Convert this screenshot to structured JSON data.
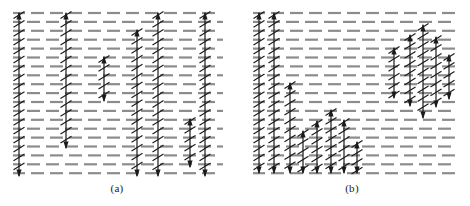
{
  "figure": {
    "background_color": "#ffffff",
    "dash_color": "#8c8c8c",
    "arrow_color": "#1a1a1a",
    "width": 470,
    "height": 206
  },
  "panels": [
    {
      "id": "a",
      "caption": "(a)",
      "caption_x": 117,
      "caption_y": 182,
      "x": 12,
      "y": 10,
      "width": 212,
      "height": 166,
      "lattice": {
        "rows": 19,
        "row_spacing": 8.9,
        "dash_length": 13,
        "dash_gap": 6,
        "dash_thickness": 2.2
      },
      "arrows": [
        {
          "x": 19,
          "y_top": 13,
          "y_bottom": 176,
          "head_top": true,
          "head_bottom": true
        },
        {
          "x": 66,
          "y_top": 13,
          "y_bottom": 148,
          "head_top": true,
          "head_bottom": true
        },
        {
          "x": 104,
          "y_top": 57,
          "y_bottom": 101,
          "head_top": true,
          "head_bottom": true
        },
        {
          "x": 137,
          "y_top": 30,
          "y_bottom": 176,
          "head_top": true,
          "head_bottom": true
        },
        {
          "x": 158,
          "y_top": 13,
          "y_bottom": 176,
          "head_top": true,
          "head_bottom": true
        },
        {
          "x": 190,
          "y_top": 119,
          "y_bottom": 167,
          "head_top": true,
          "head_bottom": true
        },
        {
          "x": 205,
          "y_top": 13,
          "y_bottom": 176,
          "head_top": true,
          "head_bottom": true
        }
      ]
    },
    {
      "id": "b",
      "caption": "(b)",
      "caption_x": 352,
      "caption_y": 182,
      "x": 252,
      "y": 10,
      "width": 206,
      "height": 166,
      "lattice": {
        "rows": 19,
        "row_spacing": 8.9,
        "dash_length": 13,
        "dash_gap": 6,
        "dash_thickness": 2.2
      },
      "arrows": [
        {
          "x": 259,
          "y_top": 13,
          "y_bottom": 173,
          "head_top": true,
          "head_bottom": true
        },
        {
          "x": 274,
          "y_top": 13,
          "y_bottom": 173,
          "head_top": true,
          "head_bottom": true
        },
        {
          "x": 290,
          "y_top": 83,
          "y_bottom": 173,
          "head_top": true,
          "head_bottom": true
        },
        {
          "x": 303,
          "y_top": 131,
          "y_bottom": 173,
          "head_top": true,
          "head_bottom": true
        },
        {
          "x": 317,
          "y_top": 121,
          "y_bottom": 173,
          "head_top": true,
          "head_bottom": true
        },
        {
          "x": 331,
          "y_top": 110,
          "y_bottom": 173,
          "head_top": true,
          "head_bottom": true
        },
        {
          "x": 344,
          "y_top": 120,
          "y_bottom": 173,
          "head_top": true,
          "head_bottom": true
        },
        {
          "x": 357,
          "y_top": 142,
          "y_bottom": 173,
          "head_top": true,
          "head_bottom": true
        },
        {
          "x": 394,
          "y_top": 48,
          "y_bottom": 98,
          "head_top": true,
          "head_bottom": true
        },
        {
          "x": 410,
          "y_top": 35,
          "y_bottom": 106,
          "head_top": true,
          "head_bottom": true
        },
        {
          "x": 423,
          "y_top": 25,
          "y_bottom": 118,
          "head_top": true,
          "head_bottom": true
        },
        {
          "x": 436,
          "y_top": 37,
          "y_bottom": 107,
          "head_top": true,
          "head_bottom": true
        },
        {
          "x": 449,
          "y_top": 55,
          "y_bottom": 99,
          "head_top": true,
          "head_bottom": true
        }
      ]
    }
  ]
}
